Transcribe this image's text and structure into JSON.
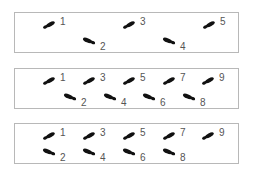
{
  "diagram": {
    "panels": [
      {
        "name": "panel-1",
        "top": 12,
        "footprints": [
          {
            "label": "1",
            "row": "upper",
            "x": 40,
            "y": 21
          },
          {
            "label": "2",
            "row": "lower",
            "x": 80,
            "y": 37
          },
          {
            "label": "3",
            "row": "upper",
            "x": 120,
            "y": 21
          },
          {
            "label": "4",
            "row": "lower",
            "x": 160,
            "y": 37
          },
          {
            "label": "5",
            "row": "upper",
            "x": 200,
            "y": 21
          }
        ]
      },
      {
        "name": "panel-2",
        "top": 68,
        "footprints": [
          {
            "label": "1",
            "row": "upper",
            "x": 40,
            "y": 77
          },
          {
            "label": "2",
            "row": "lower",
            "x": 61,
            "y": 93
          },
          {
            "label": "3",
            "row": "upper",
            "x": 80,
            "y": 77
          },
          {
            "label": "4",
            "row": "lower",
            "x": 101,
            "y": 93
          },
          {
            "label": "5",
            "row": "upper",
            "x": 120,
            "y": 77
          },
          {
            "label": "6",
            "row": "lower",
            "x": 140,
            "y": 93
          },
          {
            "label": "7",
            "row": "upper",
            "x": 160,
            "y": 77
          },
          {
            "label": "8",
            "row": "lower",
            "x": 180,
            "y": 93
          },
          {
            "label": "9",
            "row": "upper",
            "x": 199,
            "y": 77
          }
        ]
      },
      {
        "name": "panel-3",
        "top": 123,
        "footprints": [
          {
            "label": "1",
            "row": "upper",
            "x": 40,
            "y": 132
          },
          {
            "label": "2",
            "row": "lower",
            "x": 40,
            "y": 148
          },
          {
            "label": "3",
            "row": "upper",
            "x": 80,
            "y": 132
          },
          {
            "label": "4",
            "row": "lower",
            "x": 80,
            "y": 148
          },
          {
            "label": "5",
            "row": "upper",
            "x": 120,
            "y": 132
          },
          {
            "label": "6",
            "row": "lower",
            "x": 120,
            "y": 148
          },
          {
            "label": "7",
            "row": "upper",
            "x": 160,
            "y": 132
          },
          {
            "label": "8",
            "row": "lower",
            "x": 160,
            "y": 148
          },
          {
            "label": "9",
            "row": "upper",
            "x": 199,
            "y": 132
          }
        ]
      }
    ],
    "colors": {
      "footprint": "#111111",
      "label": "#555555",
      "border": "#b8b8b8"
    }
  }
}
